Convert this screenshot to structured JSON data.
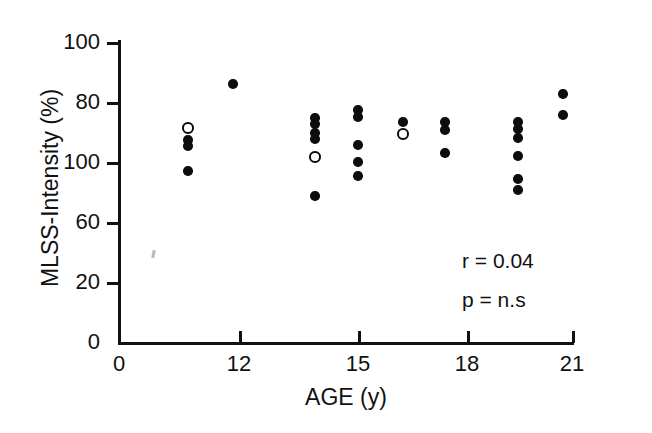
{
  "chart_data": {
    "type": "scatter",
    "title": "",
    "xlabel": "AGE (y)",
    "ylabel": "MLSS-Intensity (%)",
    "xlim": [
      0,
      21
    ],
    "ylim": [
      0,
      100
    ],
    "grid": false,
    "legend": "none",
    "x_ticks": [
      {
        "value": 0,
        "label": "0"
      },
      {
        "value": 12,
        "label": "12"
      },
      {
        "value": 15,
        "label": "15"
      },
      {
        "value": 18,
        "label": "18"
      },
      {
        "value": 21,
        "label": "21"
      }
    ],
    "y_ticks": [
      {
        "value": 100,
        "label": "100"
      },
      {
        "value": 80,
        "label": "80"
      },
      {
        "value": 60,
        "label": "100"
      },
      {
        "value": 40,
        "label": "60"
      },
      {
        "value": 20,
        "label": "20"
      },
      {
        "value": 0,
        "label": "0"
      }
    ],
    "y_tick_note": "Printed tick labels top-to-bottom read 100, 80, 100, 60, 20, 0 as they appear in the scanned figure.",
    "annotations": [
      {
        "id": "correlation",
        "text": "r = 0.04"
      },
      {
        "id": "significance",
        "text": "p = n.s"
      }
    ],
    "series": [
      {
        "name": "filled",
        "marker": "filled-circle",
        "color": "#0d0d0d",
        "points": [
          {
            "x": 10,
            "y": 93
          },
          {
            "x": 10,
            "y": 90
          },
          {
            "x": 10,
            "y": 78
          },
          {
            "x": 12,
            "y": 84
          },
          {
            "x": 14,
            "y": 96
          },
          {
            "x": 14,
            "y": 94
          },
          {
            "x": 14,
            "y": 90
          },
          {
            "x": 14,
            "y": 88
          },
          {
            "x": 14,
            "y": 70
          },
          {
            "x": 15,
            "y": 99
          },
          {
            "x": 15,
            "y": 96
          },
          {
            "x": 15,
            "y": 85
          },
          {
            "x": 15,
            "y": 80
          },
          {
            "x": 15,
            "y": 75
          },
          {
            "x": 16,
            "y": 95
          },
          {
            "x": 17,
            "y": 95
          },
          {
            "x": 17,
            "y": 92
          },
          {
            "x": 17,
            "y": 85
          },
          {
            "x": 19,
            "y": 95
          },
          {
            "x": 19,
            "y": 93
          },
          {
            "x": 19,
            "y": 90
          },
          {
            "x": 19,
            "y": 84
          },
          {
            "x": 19,
            "y": 77
          },
          {
            "x": 19,
            "y": 73
          },
          {
            "x": 20,
            "y": 105
          },
          {
            "x": 20,
            "y": 99
          }
        ]
      },
      {
        "name": "open",
        "marker": "open-circle",
        "color": "#0d0d0d",
        "points": [
          {
            "x": 10,
            "y": 96
          },
          {
            "x": 14,
            "y": 82
          },
          {
            "x": 16,
            "y": 92
          }
        ]
      }
    ]
  },
  "markers": {
    "filled": [
      {
        "cx": 188,
        "cy": 140
      },
      {
        "cx": 188,
        "cy": 146
      },
      {
        "cx": 188,
        "cy": 171
      },
      {
        "cx": 233,
        "cy": 84
      },
      {
        "cx": 315,
        "cy": 118
      },
      {
        "cx": 315,
        "cy": 124
      },
      {
        "cx": 315,
        "cy": 133
      },
      {
        "cx": 315,
        "cy": 139
      },
      {
        "cx": 315,
        "cy": 196
      },
      {
        "cx": 358,
        "cy": 110
      },
      {
        "cx": 358,
        "cy": 117
      },
      {
        "cx": 358,
        "cy": 145
      },
      {
        "cx": 358,
        "cy": 162
      },
      {
        "cx": 358,
        "cy": 176
      },
      {
        "cx": 403,
        "cy": 122
      },
      {
        "cx": 445,
        "cy": 122
      },
      {
        "cx": 445,
        "cy": 130
      },
      {
        "cx": 445,
        "cy": 153
      },
      {
        "cx": 518,
        "cy": 122
      },
      {
        "cx": 518,
        "cy": 129
      },
      {
        "cx": 518,
        "cy": 138
      },
      {
        "cx": 518,
        "cy": 156
      },
      {
        "cx": 518,
        "cy": 179
      },
      {
        "cx": 518,
        "cy": 190
      },
      {
        "cx": 563,
        "cy": 94
      },
      {
        "cx": 563,
        "cy": 115
      }
    ],
    "open": [
      {
        "cx": 188,
        "cy": 128
      },
      {
        "cx": 315,
        "cy": 157
      },
      {
        "cx": 403,
        "cy": 134
      }
    ]
  },
  "geometry": {
    "y_tick_pixels": [
      {
        "label": "100",
        "cy": 42
      },
      {
        "label": "80",
        "cy": 102
      },
      {
        "label": "100",
        "cy": 162
      },
      {
        "label": "60",
        "cy": 222
      },
      {
        "label": "20",
        "cy": 282
      },
      {
        "label": "0",
        "cy": 342
      }
    ],
    "x_tick_pixels": [
      {
        "label": "0",
        "cx": 119
      },
      {
        "label": "12",
        "cx": 239
      },
      {
        "label": "15",
        "cx": 358
      },
      {
        "label": "18",
        "cx": 467
      },
      {
        "label": "21",
        "cx": 572
      }
    ]
  }
}
